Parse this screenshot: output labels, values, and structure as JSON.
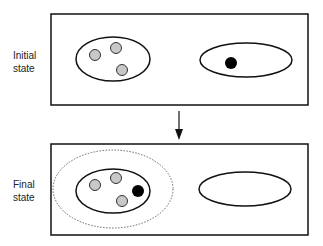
{
  "panels": [
    {
      "label_line1": "Initial",
      "label_line2": "state"
    },
    {
      "label_line1": "Final",
      "label_line2": "state"
    }
  ],
  "colors": {
    "stroke": "#111111",
    "gray_particle": "#c8c8c8",
    "black_particle": "#000000",
    "dotted": "#666666"
  }
}
